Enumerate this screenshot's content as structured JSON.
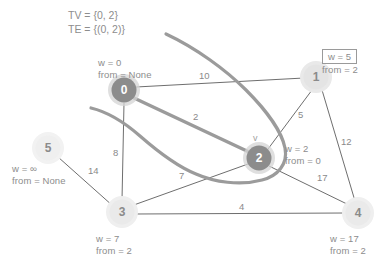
{
  "diagram": {
    "title_lines": {
      "tv": "TV = {0, 2}",
      "te": "TE = {(0, 2)}"
    },
    "current_vertex_marker": "v",
    "nodes": [
      {
        "id": "0",
        "label": "0",
        "cx": 124,
        "cy": 90,
        "r": 13,
        "state": "in-tree",
        "fill": "#8c8c8c",
        "halo": "#d0d0d0"
      },
      {
        "id": "1",
        "label": "1",
        "cx": 316,
        "cy": 77,
        "r": 13,
        "state": "frontier",
        "fill": "#e2e2e2",
        "halo": "#ececec"
      },
      {
        "id": "2",
        "label": "2",
        "cx": 259,
        "cy": 158,
        "r": 13,
        "state": "in-tree",
        "fill": "#8c8c8c",
        "halo": "#d0d0d0"
      },
      {
        "id": "3",
        "label": "3",
        "cx": 122,
        "cy": 212,
        "r": 13,
        "state": "frontier",
        "fill": "#e8e8e8",
        "halo": "#f0f0f0"
      },
      {
        "id": "4",
        "label": "4",
        "cx": 358,
        "cy": 213,
        "r": 13,
        "state": "frontier",
        "fill": "#e8e8e8",
        "halo": "#f0f0f0"
      },
      {
        "id": "5",
        "label": "5",
        "cx": 48,
        "cy": 148,
        "r": 13,
        "state": "unvisited",
        "fill": "#ededed",
        "halo": "#f4f4f4"
      }
    ],
    "node_annotations": [
      {
        "node": "0",
        "w_text": "w = 0",
        "from_text": "from = None",
        "x": 98,
        "y": 57,
        "boxed": false
      },
      {
        "node": "1",
        "w_text": "w = 5",
        "from_text": "from = 2",
        "x": 330,
        "y": 50,
        "boxed": true
      },
      {
        "node": "2",
        "w_text": "w = 2",
        "from_text": "from = 0",
        "x": 285,
        "y": 143,
        "boxed": false
      },
      {
        "node": "3",
        "w_text": "w = 7",
        "from_text": "from = 2",
        "x": 96,
        "y": 233,
        "boxed": false
      },
      {
        "node": "4",
        "w_text": "w = 17",
        "from_text": "from = 2",
        "x": 330,
        "y": 233,
        "boxed": false
      },
      {
        "node": "5",
        "w_text": "w = ∞",
        "from_text": "from = None",
        "x": 12,
        "y": 163,
        "boxed": false
      }
    ],
    "edges": [
      {
        "from": "0",
        "to": "1",
        "weight": "10",
        "label_x": 199,
        "label_y": 71,
        "in_tree": false
      },
      {
        "from": "0",
        "to": "2",
        "weight": "2",
        "label_x": 193,
        "label_y": 112,
        "in_tree": true
      },
      {
        "from": "0",
        "to": "3",
        "weight": "8",
        "label_x": 113,
        "label_y": 148,
        "in_tree": false
      },
      {
        "from": "1",
        "to": "2",
        "weight": "5",
        "label_x": 298,
        "label_y": 110,
        "in_tree": false
      },
      {
        "from": "1",
        "to": "4",
        "weight": "12",
        "label_x": 341,
        "label_y": 137,
        "in_tree": false
      },
      {
        "from": "2",
        "to": "3",
        "weight": "7",
        "label_x": 179,
        "label_y": 171,
        "in_tree": false
      },
      {
        "from": "2",
        "to": "4",
        "weight": "17",
        "label_x": 317,
        "label_y": 173,
        "in_tree": false
      },
      {
        "from": "3",
        "to": "4",
        "weight": "4",
        "label_x": 239,
        "label_y": 202,
        "in_tree": false
      },
      {
        "from": "5",
        "to": "3",
        "weight": "14",
        "label_x": 88,
        "label_y": 166,
        "in_tree": false
      }
    ],
    "colors": {
      "edge": "#6e6e6e",
      "tree_edge": "#9a9a9a",
      "frontier_curve": "#9a9a9a",
      "text": "#8d8d8d",
      "node_in_tree": "#8c8c8c",
      "node_frontier": "#e6e6e6",
      "background": "#ffffff"
    }
  }
}
